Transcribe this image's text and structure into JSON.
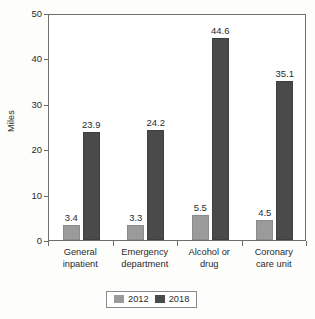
{
  "chart_data": {
    "type": "bar",
    "title": "",
    "subtitle": "",
    "xlabel": "",
    "ylabel": "Miles",
    "ylim": [
      0,
      50
    ],
    "yticks": [
      0,
      10,
      20,
      30,
      40,
      50
    ],
    "ytick_labels": [
      "0",
      "10",
      "20",
      "30",
      "40",
      "50"
    ],
    "grid": false,
    "legend_position": "bottom",
    "categories": [
      "General inpatient",
      "Emergency department",
      "Alcohol or drug",
      "Coronary care unit"
    ],
    "category_lines": [
      [
        "General",
        "inpatient"
      ],
      [
        "Emergency",
        "department"
      ],
      [
        "Alcohol or",
        "drug"
      ],
      [
        "Coronary",
        "care unit"
      ]
    ],
    "series": [
      {
        "name": "2012",
        "color": "#9b9b9b",
        "values": [
          3.4,
          3.3,
          5.5,
          4.5
        ],
        "labels": [
          "3.4",
          "3.3",
          "5.5",
          "4.5"
        ]
      },
      {
        "name": "2018",
        "color": "#4a4a4a",
        "values": [
          23.9,
          24.2,
          44.6,
          35.1
        ],
        "labels": [
          "23.9",
          "24.2",
          "44.6",
          "35.1"
        ]
      }
    ]
  },
  "legend": {
    "entries": [
      {
        "label": "2012",
        "color": "#9b9b9b"
      },
      {
        "label": "2018",
        "color": "#4a4a4a"
      }
    ]
  }
}
